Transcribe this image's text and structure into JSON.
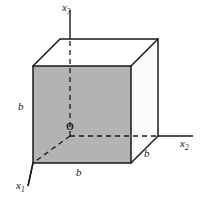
{
  "figure": {
    "background_color": "#ffffff",
    "width": 200,
    "height": 198
  },
  "colors": {
    "stroke": "#1a1a1a",
    "front_face_fill": "#b3b3b3",
    "right_face_fill": "#fbfbfb",
    "top_face_fill": "#ffffff",
    "label_color": "#1a1a1a"
  },
  "axes": [
    {
      "id": "x3",
      "label": "x",
      "subscript": "3",
      "direction": "up",
      "from": [
        70,
        136
      ],
      "to": [
        70,
        10
      ],
      "style": "solid-above-cube-dashed-inside"
    },
    {
      "id": "x2",
      "label": "x",
      "subscript": "2",
      "direction": "right",
      "from": [
        70,
        136
      ],
      "to": [
        193,
        136
      ],
      "style": "dashed-inside-solid-outside"
    },
    {
      "id": "x1",
      "label": "x",
      "subscript": "1",
      "direction": "down-left",
      "from": [
        70,
        136
      ],
      "to": [
        28,
        186
      ],
      "style": "dashed-inside-solid-outside"
    }
  ],
  "origin": {
    "label": "O",
    "position": [
      70,
      136
    ]
  },
  "dimensions": [
    {
      "id": "b-left",
      "label": "b",
      "edge": "front-left-vertical",
      "position": [
        18,
        101
      ]
    },
    {
      "id": "b-bottom",
      "label": "b",
      "edge": "front-bottom-horizontal",
      "position": [
        76,
        167
      ]
    },
    {
      "id": "b-right",
      "label": "b",
      "edge": "bottom-right-depth",
      "position": [
        144,
        148
      ]
    }
  ],
  "cube": {
    "edge_length_label": "b",
    "vertices": {
      "front_top_left": [
        33,
        66
      ],
      "front_top_right": [
        131,
        66
      ],
      "front_bottom_right": [
        131,
        163
      ],
      "front_bottom_left": [
        33,
        163
      ],
      "back_top_left": [
        60,
        39
      ],
      "back_top_right": [
        158,
        39
      ],
      "back_bottom_right": [
        158,
        136
      ],
      "back_bottom_left": [
        70,
        136
      ]
    },
    "faces": [
      {
        "name": "front-face",
        "fill": "#b3b3b3",
        "visible": true
      },
      {
        "name": "right-face",
        "fill": "#fbfbfb",
        "visible": true
      },
      {
        "name": "top-face",
        "fill": "#ffffff",
        "visible": true
      }
    ],
    "hidden_edges": [
      {
        "name": "hidden-vertical-edge",
        "from": [
          70,
          136
        ],
        "to": [
          70,
          39
        ]
      },
      {
        "name": "hidden-depth-edge-right",
        "from": [
          70,
          136
        ],
        "to": [
          158,
          136
        ]
      },
      {
        "name": "hidden-depth-edge-left",
        "from": [
          70,
          136
        ],
        "to": [
          33,
          163
        ]
      }
    ]
  }
}
